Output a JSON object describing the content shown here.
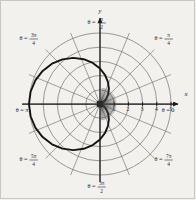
{
  "figure": {
    "kind": "polar-coordinate-plot",
    "background_color": "#f2f1ee",
    "grid_color": "#6e6e6e",
    "axis_color": "#1a1a1a",
    "curve_color": "#141414"
  },
  "axes": {
    "x_axis_label": "x",
    "y_axis_label": "y",
    "origin_label": "",
    "x_ticks": [
      "1",
      "2",
      "3",
      "4",
      "5"
    ],
    "y_ticks": []
  },
  "angle_labels": [
    {
      "name": "theta-0",
      "prefix": "θ =",
      "whole": "0",
      "num": "",
      "den": ""
    },
    {
      "name": "theta-pi-4",
      "prefix": "θ =",
      "whole": "",
      "num": "π",
      "den": "4"
    },
    {
      "name": "theta-pi-2",
      "prefix": "θ =",
      "whole": "",
      "num": "π",
      "den": "2"
    },
    {
      "name": "theta-3pi-4",
      "prefix": "θ =",
      "whole": "",
      "num": "3π",
      "den": "4"
    },
    {
      "name": "theta-pi",
      "prefix": "θ =",
      "whole": "π",
      "num": "",
      "den": ""
    },
    {
      "name": "theta-5pi-4",
      "prefix": "θ =",
      "whole": "",
      "num": "5π",
      "den": "4"
    },
    {
      "name": "theta-3pi-2",
      "prefix": "θ =",
      "whole": "",
      "num": "3π",
      "den": "2"
    },
    {
      "name": "theta-7pi-4",
      "prefix": "θ =",
      "whole": "",
      "num": "7π",
      "den": "4"
    }
  ],
  "chart_data": {
    "type": "line",
    "coordinate_system": "polar",
    "title": "",
    "xlabel": "x",
    "ylabel": "y",
    "grid": true,
    "legend": false,
    "rlim": [
      0,
      5
    ],
    "r_rings": [
      1,
      2,
      3,
      4,
      5
    ],
    "theta_spokes_deg": [
      0,
      22.5,
      45,
      67.5,
      90,
      112.5,
      135,
      157.5,
      180,
      202.5,
      225,
      247.5,
      270,
      292.5,
      315,
      337.5
    ],
    "theta_tick_labels": [
      "θ = 0",
      "θ = π/4",
      "θ = π/2",
      "θ = 3π/4",
      "θ = π",
      "θ = 5π/4",
      "θ = 3π/2",
      "θ = 7π/4"
    ],
    "series": [
      {
        "name": "cardioid",
        "equation": "r = 2.5(1 - cos θ)",
        "closed": true,
        "cusp_at_origin": true,
        "max_r": 5,
        "max_r_theta": "π",
        "points_polar_deg": [
          [
            0,
            0.0
          ],
          [
            10,
            0.038
          ],
          [
            20,
            0.151
          ],
          [
            30,
            0.335
          ],
          [
            40,
            0.585
          ],
          [
            50,
            0.893
          ],
          [
            60,
            1.25
          ],
          [
            70,
            1.645
          ],
          [
            80,
            2.066
          ],
          [
            90,
            2.5
          ],
          [
            100,
            2.934
          ],
          [
            110,
            3.355
          ],
          [
            120,
            3.75
          ],
          [
            130,
            4.107
          ],
          [
            140,
            4.415
          ],
          [
            150,
            4.665
          ],
          [
            160,
            4.849
          ],
          [
            170,
            4.962
          ],
          [
            180,
            5.0
          ],
          [
            190,
            4.962
          ],
          [
            200,
            4.849
          ],
          [
            210,
            4.665
          ],
          [
            220,
            4.415
          ],
          [
            230,
            4.107
          ],
          [
            240,
            3.75
          ],
          [
            250,
            3.355
          ],
          [
            260,
            2.934
          ],
          [
            270,
            2.5
          ],
          [
            280,
            2.066
          ],
          [
            290,
            1.645
          ],
          [
            300,
            1.25
          ],
          [
            310,
            0.893
          ],
          [
            320,
            0.585
          ],
          [
            330,
            0.335
          ],
          [
            340,
            0.151
          ],
          [
            350,
            0.038
          ],
          [
            360,
            0.0
          ]
        ]
      }
    ]
  }
}
